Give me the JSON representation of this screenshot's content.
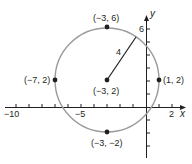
{
  "figure": {
    "title": "",
    "circle": {
      "center": {
        "x": -3,
        "y": 2
      },
      "radius": 4,
      "stroke": "#9a9a9a"
    },
    "radius_label": "4",
    "points": [
      {
        "label": "(−3, 6)",
        "x": -3,
        "y": 6
      },
      {
        "label": "(−7, 2)",
        "x": -7,
        "y": 2
      },
      {
        "label": "(1, 2)",
        "x": 1,
        "y": 2
      },
      {
        "label": "(−3, 2)",
        "x": -3,
        "y": 2
      },
      {
        "label": "(−3, −2)",
        "x": -3,
        "y": -2
      }
    ],
    "axes": {
      "x_label": "x",
      "y_label": "y",
      "x_ticks": [
        "−10",
        "−5",
        "2"
      ],
      "y_ticks": [
        "6"
      ]
    },
    "colors": {
      "ink": "#231f20",
      "circle": "#9a9a9a"
    }
  }
}
